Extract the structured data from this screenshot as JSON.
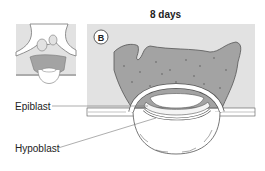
{
  "figure": {
    "title": "8 days",
    "panel_label": "B",
    "labels": {
      "epiblast": "Epiblast",
      "hypoblast": "Hypoblast"
    },
    "colors": {
      "background_box": "#e2e2e2",
      "syncytiotrophoblast": "#a3a3a3",
      "outline": "#555555",
      "cells": "#ffffff"
    }
  }
}
